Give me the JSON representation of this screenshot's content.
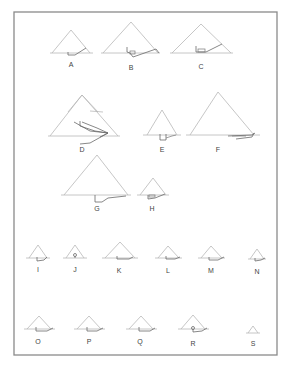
{
  "figure": {
    "title": "",
    "labels": {
      "A": "A",
      "B": "B",
      "C": "C",
      "D": "D",
      "E": "E",
      "F": "F",
      "G": "G",
      "H": "H",
      "I": "I",
      "J": "J",
      "K": "K",
      "L": "L",
      "M": "M",
      "N": "N",
      "O": "O",
      "P": "P",
      "Q": "Q",
      "R": "R",
      "S": "S"
    },
    "colors": {
      "frame": "#8a8a8a",
      "outline": "#b8b8b8",
      "passage": "#6a6a6a",
      "background": "#ffffff"
    }
  }
}
